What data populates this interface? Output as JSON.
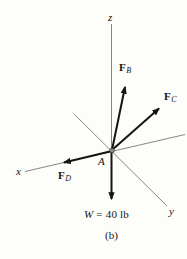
{
  "figure": {
    "caption": "(b)",
    "origin_label": "A",
    "axes": {
      "z": {
        "label": "z"
      },
      "x": {
        "label": "x"
      },
      "y": {
        "label": "y"
      }
    },
    "forces": [
      {
        "name": "F_B",
        "symbol": "F",
        "subscript": "B"
      },
      {
        "name": "F_C",
        "symbol": "F",
        "subscript": "C"
      },
      {
        "name": "F_D",
        "symbol": "F",
        "subscript": "D"
      }
    ],
    "weight": {
      "symbol": "W",
      "value": "= 40 lb"
    },
    "colors": {
      "background": "#fdfdfa",
      "axis_line": "#666666",
      "vector": "#141414",
      "origin_dot": "#8f8f8f"
    }
  }
}
